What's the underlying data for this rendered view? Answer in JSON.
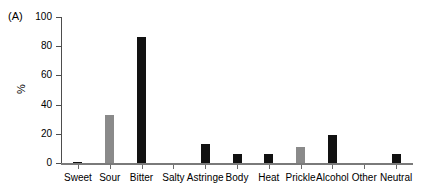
{
  "figure": {
    "panel_label": "(A)",
    "y_axis_title": "%"
  },
  "chart_data": {
    "type": "bar",
    "title": "",
    "subtitle": "",
    "xlabel": "",
    "ylabel": "%",
    "ylim": [
      0,
      100
    ],
    "yticks": [
      0,
      20,
      40,
      60,
      80,
      100
    ],
    "ytick_labels": [
      "0",
      "20",
      "40",
      "60",
      "80",
      "100"
    ],
    "grid": false,
    "legend": null,
    "categories": [
      "Sweet",
      "Sour",
      "Bitter",
      "Salty",
      "Astringe",
      "Body",
      "Heat",
      "Prickle",
      "Alcohol",
      "Other",
      "Neutral"
    ],
    "values": [
      1,
      33,
      86,
      0,
      13,
      6,
      6,
      11,
      19,
      0,
      6
    ],
    "bar_colors": [
      "#111111",
      "#8a8a8a",
      "#111111",
      "#111111",
      "#111111",
      "#111111",
      "#111111",
      "#8a8a8a",
      "#111111",
      "#111111",
      "#111111"
    ],
    "colors": {
      "black": "#111111",
      "gray": "#8a8a8a",
      "axis": "#4d4d4d",
      "background": "#ffffff"
    }
  }
}
